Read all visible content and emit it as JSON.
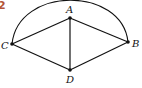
{
  "figure": {
    "number": "2",
    "number_color": "#b5563a",
    "vertices": [
      {
        "label": "A",
        "x": 70,
        "y": 18
      },
      {
        "label": "B",
        "x": 128,
        "y": 42
      },
      {
        "label": "C",
        "x": 12,
        "y": 44
      },
      {
        "label": "D",
        "x": 70,
        "y": 70
      }
    ],
    "edges": [
      [
        "C",
        "A"
      ],
      [
        "A",
        "B"
      ],
      [
        "C",
        "D"
      ],
      [
        "D",
        "B"
      ],
      [
        "A",
        "D"
      ]
    ],
    "arc": {
      "from": "C",
      "to": "B",
      "through": "top"
    }
  }
}
